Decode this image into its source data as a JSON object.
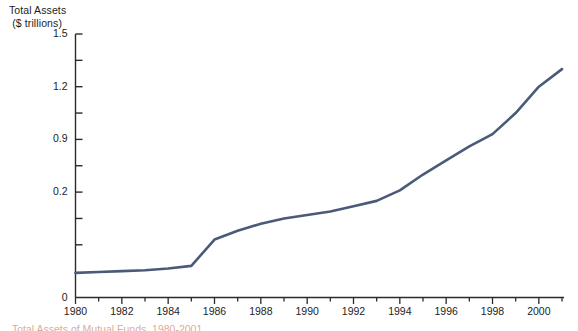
{
  "figure": {
    "background_color": "#ffffff",
    "line_color": "#4a5a78",
    "axis_color": "#2b2b2b",
    "caption_color": "#c8633f"
  },
  "axis_titles": {
    "y_line1": "Total Assets",
    "y_line2": "($ trillions)"
  },
  "y_ticks": [
    {
      "label": "1.5",
      "value": 1.5
    },
    {
      "label": "1.2",
      "value": 1.2
    },
    {
      "label": "0.9",
      "value": 0.9
    },
    {
      "label": "0.2",
      "value": 0.6
    },
    {
      "label": "0",
      "value": 0.0
    }
  ],
  "x_ticks": [
    {
      "label": "1980",
      "value": 1980
    },
    {
      "label": "1982",
      "value": 1982
    },
    {
      "label": "1984",
      "value": 1984
    },
    {
      "label": "1986",
      "value": 1986
    },
    {
      "label": "1988",
      "value": 1988
    },
    {
      "label": "1990",
      "value": 1990
    },
    {
      "label": "1992",
      "value": 1992
    },
    {
      "label": "1994",
      "value": 1994
    },
    {
      "label": "1996",
      "value": 1996
    },
    {
      "label": "1998",
      "value": 1998
    },
    {
      "label": "2000",
      "value": 2000
    }
  ],
  "caption": {
    "text": "Total Assets of Mutual Funds, 1980-2001"
  },
  "chart_data": {
    "type": "line",
    "title": "Total Assets",
    "subtitle": "($ trillions)",
    "xlabel": "",
    "ylabel": "Total Assets ($ trillions)",
    "xlim": [
      1980,
      2001
    ],
    "ylim": [
      0,
      1.5
    ],
    "grid": false,
    "legend": "none",
    "y_tick_labels": [
      "0",
      "0.2",
      "0.9",
      "1.2",
      "1.5"
    ],
    "y_tick_values": [
      0,
      0.6,
      0.9,
      1.2,
      1.5
    ],
    "x_tick_labels": [
      "1980",
      "1982",
      "1984",
      "1986",
      "1988",
      "1990",
      "1992",
      "1994",
      "1996",
      "1998",
      "2000"
    ],
    "x_minor_tick_interval": 1,
    "x_major_tick_interval": 2,
    "series": [
      {
        "name": "Total Assets",
        "color": "#4a5a78",
        "x": [
          1980,
          1981,
          1982,
          1983,
          1984,
          1985,
          1986,
          1987,
          1988,
          1989,
          1990,
          1991,
          1992,
          1993,
          1994,
          1995,
          1996,
          1997,
          1998,
          1999,
          2000,
          2001
        ],
        "values": [
          0.14,
          0.145,
          0.15,
          0.155,
          0.165,
          0.18,
          0.33,
          0.38,
          0.42,
          0.45,
          0.47,
          0.49,
          0.52,
          0.55,
          0.61,
          0.7,
          0.78,
          0.86,
          0.93,
          1.05,
          1.2,
          1.3
        ]
      }
    ]
  }
}
